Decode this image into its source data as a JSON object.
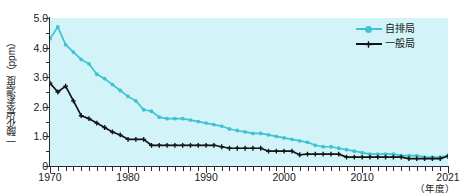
{
  "chart_data": {
    "type": "line",
    "title": "",
    "xlabel": "（年度）",
    "ylabel": "一酸化炭素濃度（ppm）",
    "xlim": [
      1970,
      2021
    ],
    "ylim": [
      0,
      5.0
    ],
    "yticks": [
      "0",
      "1.0",
      "2.0",
      "3.0",
      "4.0",
      "5.0"
    ],
    "ytick_values": [
      0,
      1.0,
      2.0,
      3.0,
      4.0,
      5.0
    ],
    "xticks": [
      "1970",
      "1980",
      "1990",
      "2000",
      "2010",
      "2021"
    ],
    "xtick_values": [
      1970,
      1980,
      1990,
      2000,
      2010,
      2021
    ],
    "grid": false,
    "legend_position": "top-right",
    "background_color": "#d2f4f8",
    "x": [
      1970,
      1971,
      1972,
      1973,
      1974,
      1975,
      1976,
      1977,
      1978,
      1979,
      1980,
      1981,
      1982,
      1983,
      1984,
      1985,
      1986,
      1987,
      1988,
      1989,
      1990,
      1991,
      1992,
      1993,
      1994,
      1995,
      1996,
      1997,
      1998,
      1999,
      2000,
      2001,
      2002,
      2003,
      2004,
      2005,
      2006,
      2007,
      2008,
      2009,
      2010,
      2011,
      2012,
      2013,
      2014,
      2015,
      2016,
      2017,
      2018,
      2019,
      2020,
      2021
    ],
    "series": [
      {
        "name": "自排局",
        "color": "#3fc3d2",
        "marker": "circle",
        "values": [
          4.3,
          4.7,
          4.1,
          3.85,
          3.6,
          3.45,
          3.1,
          2.95,
          2.75,
          2.55,
          2.35,
          2.2,
          1.9,
          1.85,
          1.65,
          1.6,
          1.6,
          1.6,
          1.55,
          1.5,
          1.45,
          1.4,
          1.35,
          1.25,
          1.2,
          1.15,
          1.1,
          1.1,
          1.05,
          1.0,
          0.95,
          0.9,
          0.85,
          0.8,
          0.7,
          0.65,
          0.65,
          0.6,
          0.55,
          0.5,
          0.45,
          0.4,
          0.4,
          0.4,
          0.4,
          0.35,
          0.35,
          0.35,
          0.3,
          0.3,
          0.3,
          0.35
        ]
      },
      {
        "name": "一般局",
        "color": "#141414",
        "marker": "plus",
        "values": [
          2.8,
          2.5,
          2.7,
          2.2,
          1.7,
          1.6,
          1.45,
          1.3,
          1.15,
          1.05,
          0.9,
          0.9,
          0.9,
          0.7,
          0.7,
          0.7,
          0.7,
          0.7,
          0.7,
          0.7,
          0.7,
          0.7,
          0.65,
          0.6,
          0.6,
          0.6,
          0.6,
          0.6,
          0.5,
          0.5,
          0.5,
          0.5,
          0.38,
          0.4,
          0.4,
          0.4,
          0.4,
          0.4,
          0.3,
          0.3,
          0.3,
          0.3,
          0.3,
          0.3,
          0.3,
          0.3,
          0.25,
          0.25,
          0.25,
          0.25,
          0.25,
          0.33
        ]
      }
    ]
  },
  "legend": {
    "items": [
      {
        "label": "自排局",
        "color": "#3fc3d2"
      },
      {
        "label": "一般局",
        "color": "#141414"
      }
    ]
  },
  "axes": {
    "y_title": "一酸化炭素濃度（ppm）",
    "x_unit": "（年度）"
  }
}
